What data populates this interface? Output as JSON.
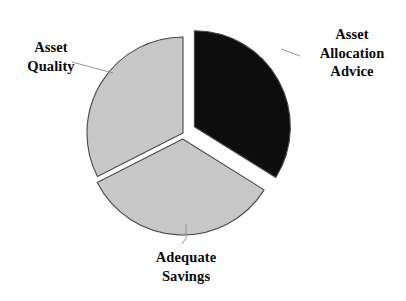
{
  "chart_data": {
    "type": "pie",
    "title": "",
    "subtitle": "",
    "xlabel": "",
    "ylabel": "",
    "legend_position": "none",
    "grid": false,
    "labels_position": "outside-with-leader-lines",
    "total": 100,
    "categories": [
      "Asset Allocation Advice",
      "Adequate Savings",
      "Asset Quality"
    ],
    "values": [
      34,
      33,
      33
    ],
    "slices": [
      {
        "label": "Asset Allocation Advice",
        "label_lines": [
          "Asset",
          "Allocation",
          "Advice"
        ],
        "value": 34,
        "percent": 34,
        "start_angle_deg": 0,
        "end_angle_deg": 122,
        "color": "#0d0d0d",
        "exploded": true,
        "explode_offset_px": 13
      },
      {
        "label": "Adequate Savings",
        "label_lines": [
          "Adequate",
          "Savings"
        ],
        "value": 33,
        "percent": 33,
        "start_angle_deg": 122,
        "end_angle_deg": 243,
        "color": "#c7c7c7",
        "exploded": true,
        "explode_offset_px": 6
      },
      {
        "label": "Asset Quality",
        "label_lines": [
          "Asset",
          "Quality"
        ],
        "value": 33,
        "percent": 33,
        "start_angle_deg": 243,
        "end_angle_deg": 360,
        "color": "#c7c7c7",
        "exploded": false,
        "explode_offset_px": 0
      }
    ],
    "geometry": {
      "center_x": 183,
      "center_y": 133,
      "radius": 96
    },
    "style": {
      "background": "#ffffff",
      "outline_color": "#4a4a4a",
      "leader_line_color": "#8a8a8a",
      "text_color": "#0a0a0a"
    }
  },
  "labels": {
    "asset_allocation_advice": {
      "line1": "Asset",
      "line2": "Allocation",
      "line3": "Advice"
    },
    "asset_quality": {
      "line1": "Asset",
      "line2": "Quality"
    },
    "adequate_savings": {
      "line1": "Adequate",
      "line2": "Savings"
    }
  }
}
